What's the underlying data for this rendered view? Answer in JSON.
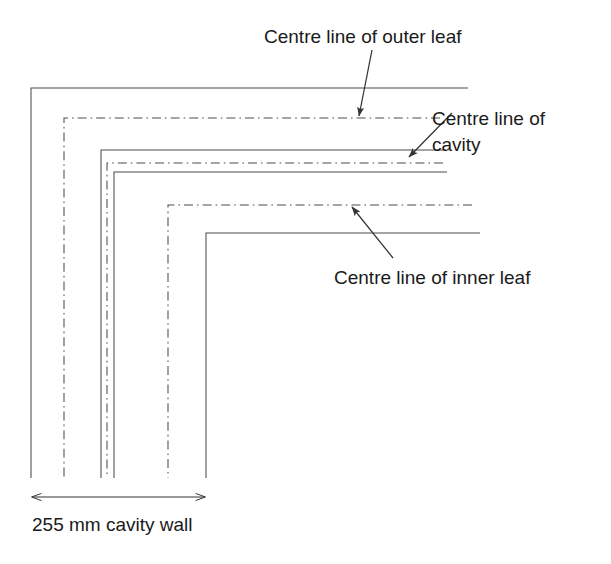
{
  "figure": {
    "background_color": "#ffffff",
    "line_color": "#4d4d4d",
    "text_color": "#1a1a1a",
    "width": 611,
    "height": 564
  },
  "labels": {
    "outer_leaf": "Centre line of outer leaf",
    "cavity_line1": "Centre line of",
    "cavity_line2": "cavity",
    "inner_leaf": "Centre line of inner leaf"
  },
  "dimension": {
    "caption": "255 mm cavity wall",
    "value": "255",
    "unit": "mm",
    "description": "cavity wall",
    "start_x": 32,
    "end_x": 205,
    "y": 497
  },
  "wall_lines": [
    {
      "name": "outer-leaf-outer-face",
      "style": "solid",
      "corner_x": 31,
      "corner_y": 88,
      "right_end_x": 468,
      "bottom_end_y": 478
    },
    {
      "name": "outer-leaf-centre-line",
      "style": "dash-dot",
      "corner_x": 64,
      "corner_y": 118,
      "right_end_x": 440,
      "bottom_end_y": 478
    },
    {
      "name": "outer-leaf-inner-face",
      "style": "solid",
      "corner_x": 101,
      "corner_y": 150,
      "right_end_x": 446,
      "bottom_end_y": 478
    },
    {
      "name": "cavity-centre-line",
      "style": "dash-dot",
      "corner_x": 107,
      "corner_y": 163,
      "right_end_x": 443,
      "bottom_end_y": 478
    },
    {
      "name": "inner-leaf-outer-face",
      "style": "solid",
      "corner_x": 114,
      "corner_y": 172,
      "right_end_x": 447,
      "bottom_end_y": 478
    },
    {
      "name": "inner-leaf-centre-line",
      "style": "dash-dot",
      "corner_x": 168,
      "corner_y": 205,
      "right_end_x": 472,
      "bottom_end_y": 478
    },
    {
      "name": "inner-leaf-inner-face",
      "style": "solid",
      "corner_x": 206,
      "corner_y": 233,
      "right_end_x": 480,
      "bottom_end_y": 478
    }
  ],
  "leaders": [
    {
      "name": "outer-leaf-leader",
      "from_x": 372,
      "from_y": 50,
      "to_x": 359,
      "to_y": 116
    },
    {
      "name": "cavity-leader",
      "from_x": 452,
      "from_y": 113,
      "to_x": 409,
      "to_y": 157
    },
    {
      "name": "inner-leaf-leader",
      "from_x": 393,
      "from_y": 258,
      "to_x": 352,
      "to_y": 207
    }
  ]
}
